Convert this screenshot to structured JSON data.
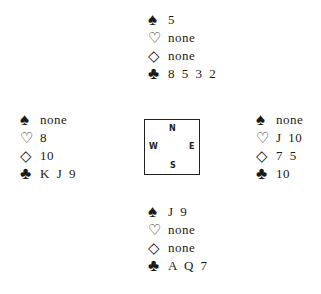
{
  "suits": {
    "spade": "♠",
    "heart": "♡",
    "diamond": "◇",
    "club": "♣"
  },
  "hands": {
    "north": {
      "spades": "5",
      "hearts": "none",
      "diamonds": "none",
      "clubs": "8 5 3 2"
    },
    "west": {
      "spades": "none",
      "hearts": "8",
      "diamonds": "10",
      "clubs": "K J 9"
    },
    "east": {
      "spades": "none",
      "hearts": "J 10",
      "diamonds": "7 5",
      "clubs": "10"
    },
    "south": {
      "spades": "J 9",
      "hearts": "none",
      "diamonds": "none",
      "clubs": "A Q 7"
    }
  },
  "compass": {
    "n": "N",
    "w": "W",
    "e": "E",
    "s": "S"
  }
}
